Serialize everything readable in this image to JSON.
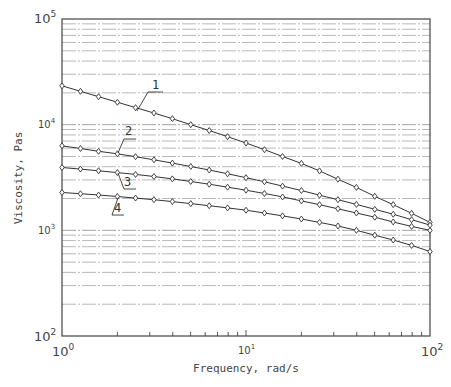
{
  "chart_data": {
    "type": "line",
    "title": "",
    "xlabel": "Frequency, rad/s",
    "ylabel": "Viscosity, Pas",
    "xscale": "log",
    "yscale": "log",
    "xlim": [
      1,
      100
    ],
    "ylim": [
      100,
      100000
    ],
    "x_tick_labels": [
      "10^0",
      "10^1",
      "10^2"
    ],
    "y_tick_labels": [
      "10^2",
      "10^3",
      "10^4",
      "10^5"
    ],
    "grid": "horizontal minor/major dash-dot lines",
    "legend": "curve numbers 1-4 with leader lines",
    "x": [
      1.0,
      1.26,
      1.58,
      2.0,
      2.51,
      3.16,
      3.98,
      5.01,
      6.31,
      7.94,
      10.0,
      12.6,
      15.8,
      20.0,
      25.1,
      31.6,
      39.8,
      50.1,
      63.1,
      79.4,
      100.0
    ],
    "series": [
      {
        "name": "1",
        "values": [
          23300,
          20700,
          18400,
          16300,
          14500,
          12900,
          11400,
          10000,
          8800,
          7700,
          6700,
          5800,
          5000,
          4300,
          3650,
          3050,
          2550,
          2100,
          1750,
          1450,
          1190
        ]
      },
      {
        "name": "2",
        "values": [
          6300,
          5950,
          5600,
          5300,
          4980,
          4650,
          4330,
          4020,
          3720,
          3430,
          3150,
          2880,
          2620,
          2380,
          2150,
          1950,
          1760,
          1580,
          1420,
          1260,
          1120
        ]
      },
      {
        "name": "3",
        "values": [
          3930,
          3800,
          3660,
          3520,
          3380,
          3230,
          3070,
          2900,
          2730,
          2560,
          2400,
          2230,
          2070,
          1900,
          1750,
          1600,
          1460,
          1330,
          1200,
          1090,
          1000
        ]
      },
      {
        "name": "4",
        "values": [
          2280,
          2220,
          2160,
          2090,
          2020,
          1950,
          1870,
          1790,
          1710,
          1630,
          1550,
          1460,
          1370,
          1280,
          1190,
          1100,
          1000,
          900,
          810,
          720,
          630
        ]
      }
    ]
  },
  "axes": {
    "x_title": "Frequency, rad/s",
    "y_title": "Viscosity, Pas",
    "x_ticks": [
      {
        "base": "10",
        "exp": "0"
      },
      {
        "base": "10",
        "exp": "1"
      },
      {
        "base": "10",
        "exp": "2"
      }
    ],
    "y_ticks": [
      {
        "base": "10",
        "exp": "5"
      },
      {
        "base": "10",
        "exp": "4"
      },
      {
        "base": "10",
        "exp": "3"
      },
      {
        "base": "10",
        "exp": "2"
      }
    ]
  },
  "curve_labels": [
    "1",
    "2",
    "3",
    "4"
  ],
  "colors": {
    "curve": "#333333",
    "grid": "#9a9a9a",
    "axis": "#444444"
  }
}
